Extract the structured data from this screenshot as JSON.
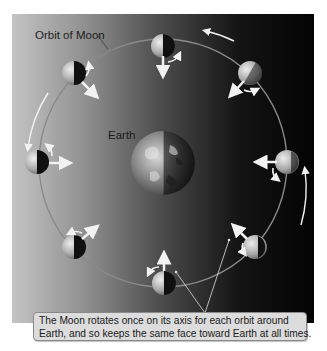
{
  "diagram": {
    "labels": {
      "orbit": "Orbit of Moon",
      "earth": "Earth"
    },
    "caption": {
      "line1": "The Moon rotates once on its axis for each orbit around",
      "line2": "Earth, and so keeps the same face toward Earth at all times."
    },
    "colors": {
      "background_light": "#bdbdbd",
      "background_dark": "#050505",
      "orbit_line": "#8a8a8a",
      "caption_bg": "#dcdcdc",
      "arrow": "#f2f2f2"
    },
    "moons": [
      {
        "position": "top",
        "x": 163,
        "y": 46
      },
      {
        "position": "top-right",
        "x": 250,
        "y": 73
      },
      {
        "position": "right",
        "x": 287,
        "y": 162
      },
      {
        "position": "bottom-right",
        "x": 255,
        "y": 247
      },
      {
        "position": "bottom",
        "x": 164,
        "y": 283
      },
      {
        "position": "bottom-left",
        "x": 74,
        "y": 247
      },
      {
        "position": "left",
        "x": 37,
        "y": 162
      },
      {
        "position": "top-left",
        "x": 74,
        "y": 73
      }
    ]
  }
}
